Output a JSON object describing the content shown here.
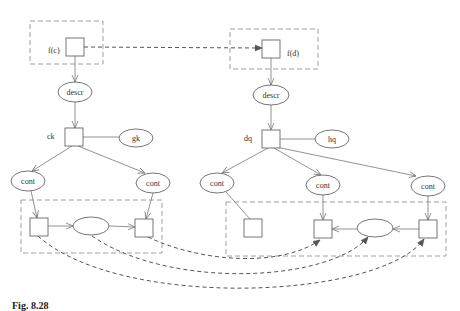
{
  "diagram": {
    "nodes": {
      "fc": {
        "label": "f(c)"
      },
      "fd": {
        "label": "f(d)"
      },
      "descr_left": {
        "label": "descr"
      },
      "descr_right": {
        "label": "descr"
      },
      "ck": {
        "label": "ck"
      },
      "gk": {
        "label": "gk"
      },
      "dq": {
        "label": "dq"
      },
      "hq": {
        "label": "hq"
      },
      "cont_left_1": {
        "label": "cont"
      },
      "cont_left_2": {
        "label": "cont"
      },
      "cont_right_1": {
        "label": "cont"
      },
      "cont_right_2": {
        "label": "cont"
      },
      "cont_right_3": {
        "label": "cont"
      }
    },
    "caption": "Fig. 8.28"
  }
}
